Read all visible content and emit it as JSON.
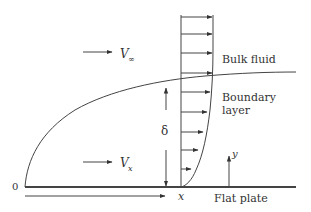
{
  "figure": {
    "type": "boundary-layer-over-flat-plate",
    "labels": {
      "freestream_velocity": "V",
      "freestream_subscript": "∞",
      "local_velocity": "V",
      "local_subscript": "x",
      "bulk_fluid": "Bulk fluid",
      "boundary_layer_line1": "Boundary",
      "boundary_layer_line2": "layer",
      "thickness": "δ",
      "origin": "0",
      "x_axis": "x",
      "y_axis": "y",
      "plate": "Flat plate"
    },
    "colors": {
      "line": "#444444",
      "text": "#333333",
      "background": "#ffffff"
    }
  }
}
